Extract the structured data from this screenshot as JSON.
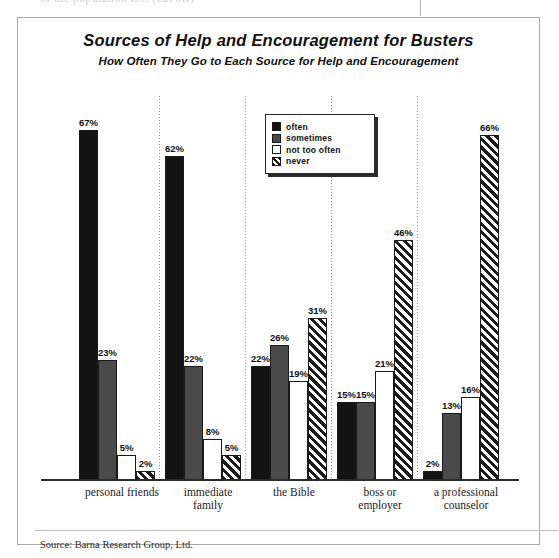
{
  "top_fragment": {
    "ghost_text": "of the population is... (cut off)"
  },
  "figure": {
    "title": "Sources of Help and Encouragement for Busters",
    "subtitle": "How Often They Go to Each Source for Help and Encouragement",
    "source": "Source: Barna Research Group, Ltd."
  },
  "legend": {
    "items": [
      {
        "label": "often",
        "key": "often",
        "color": "#131313"
      },
      {
        "label": "sometimes",
        "key": "sometimes",
        "color": "#4a4a4a"
      },
      {
        "label": "not too often",
        "key": "nottoooften",
        "color": "#ffffff"
      },
      {
        "label": "never",
        "key": "never",
        "color": "#1c1c1c"
      }
    ]
  },
  "chart_data": {
    "type": "bar",
    "title": "Sources of Help and Encouragement for Busters",
    "subtitle": "How Often They Go to Each Source for Help and Encouragement",
    "xlabel": "",
    "ylabel": "",
    "ylim": [
      0,
      70
    ],
    "grid": false,
    "legend_position": "inside-top-center",
    "value_suffix": "%",
    "categories": [
      "personal friends",
      "immediate family",
      "the Bible",
      "boss or employer",
      "a professional counselor"
    ],
    "category_lines": [
      [
        "personal friends"
      ],
      [
        "immediate",
        "family"
      ],
      [
        "the Bible"
      ],
      [
        "boss or",
        "employer"
      ],
      [
        "a professional",
        "counselor"
      ]
    ],
    "series": [
      {
        "name": "often",
        "values": [
          67,
          62,
          22,
          15,
          2
        ],
        "labels": [
          "67%",
          "62%",
          "22%",
          "15%",
          "2%"
        ]
      },
      {
        "name": "sometimes",
        "values": [
          23,
          22,
          26,
          15,
          13
        ],
        "labels": [
          "23%",
          "22%",
          "26%",
          "15%",
          "13%"
        ]
      },
      {
        "name": "not too often",
        "values": [
          5,
          8,
          19,
          21,
          16
        ],
        "labels": [
          "5%",
          "8%",
          "19%",
          "21%",
          "16%"
        ]
      },
      {
        "name": "never",
        "values": [
          2,
          5,
          31,
          46,
          66
        ],
        "labels": [
          "2%",
          "5%",
          "31%",
          "46%",
          "66%"
        ]
      }
    ],
    "annotations": [
      "Source: Barna Research Group, Ltd."
    ]
  },
  "colors": {
    "often": "#131313",
    "sometimes": "#4a4a4a",
    "not_too_often": "#ffffff",
    "never": "#1c1c1c",
    "axis": "#2a2a2a",
    "frame": "#a8a8a8"
  }
}
